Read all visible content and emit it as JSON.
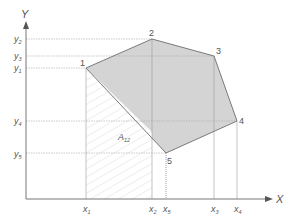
{
  "axes": {
    "x_label": "X",
    "y_label": "Y"
  },
  "points": [
    {
      "id": "1",
      "label": "1",
      "x": 86,
      "y": 68
    },
    {
      "id": "2",
      "label": "2",
      "x": 152,
      "y": 39
    },
    {
      "id": "3",
      "label": "3",
      "x": 214,
      "y": 56
    },
    {
      "id": "4",
      "label": "4",
      "x": 237,
      "y": 121
    },
    {
      "id": "5",
      "label": "5",
      "x": 166,
      "y": 153
    }
  ],
  "x_ticks": [
    {
      "base": "x",
      "sub": "1"
    },
    {
      "base": "x",
      "sub": "2"
    },
    {
      "base": "x",
      "sub": "5"
    },
    {
      "base": "x",
      "sub": "3"
    },
    {
      "base": "x",
      "sub": "4"
    }
  ],
  "y_ticks": [
    {
      "base": "y",
      "sub": "2"
    },
    {
      "base": "y",
      "sub": "3"
    },
    {
      "base": "y",
      "sub": "1"
    },
    {
      "base": "y",
      "sub": "4"
    },
    {
      "base": "y",
      "sub": "5"
    }
  ],
  "area_label": {
    "base": "A",
    "sub": "12"
  },
  "colors": {
    "polygon_fill": "#d4d4d4",
    "polygon_stroke": "#7a7a7a",
    "axis": "#777777",
    "guide": "#a8a8a8",
    "hatch": "#d8d8d8"
  }
}
